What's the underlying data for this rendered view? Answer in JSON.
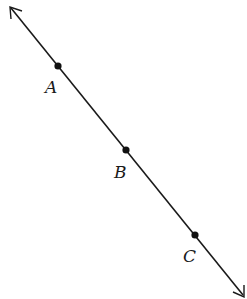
{
  "diagram": {
    "type": "line-with-points",
    "line": {
      "start": [
        10,
        7
      ],
      "end": [
        244,
        296
      ],
      "arrows": [
        "start",
        "end"
      ],
      "color": "#1a1a1a"
    },
    "points": [
      {
        "label": "A",
        "x": 58,
        "y": 66,
        "label_x": 45,
        "label_y": 93
      },
      {
        "label": "B",
        "x": 126,
        "y": 150,
        "label_x": 114,
        "label_y": 178
      },
      {
        "label": "C",
        "x": 195,
        "y": 235,
        "label_x": 183,
        "label_y": 262
      }
    ]
  }
}
